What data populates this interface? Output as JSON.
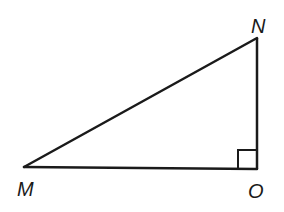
{
  "diagram": {
    "type": "right-triangle",
    "vertices": {
      "M": {
        "label": "M",
        "x": 24,
        "y": 167
      },
      "N": {
        "label": "N",
        "x": 257,
        "y": 38
      },
      "O": {
        "label": "O",
        "x": 257,
        "y": 169
      }
    },
    "right_angle_at": "O",
    "stroke_color": "#1a1a1a",
    "background": "#ffffff"
  }
}
